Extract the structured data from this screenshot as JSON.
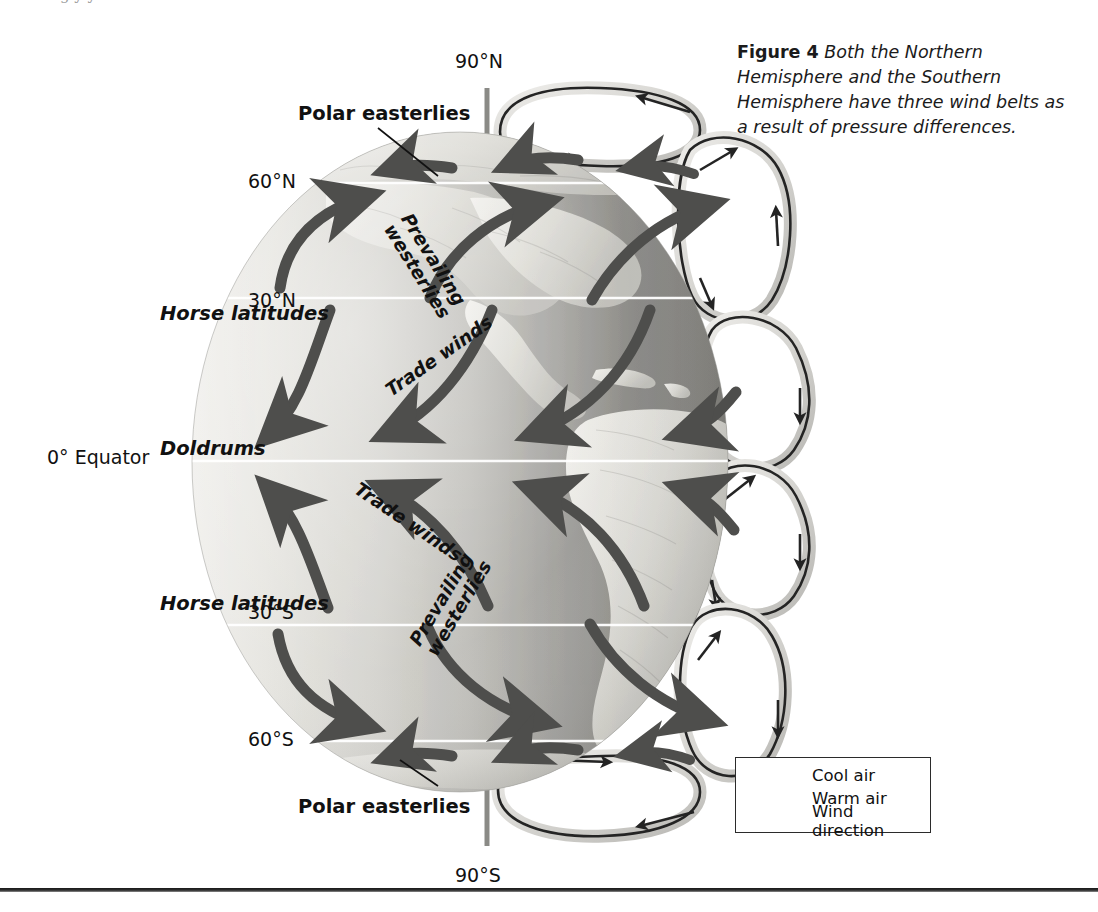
{
  "page": {
    "cutoff_text": "g       y  y"
  },
  "caption": {
    "figure_label": "Figure 4",
    "text": "Both the Northern Hemisphere and the Southern Hemisphere have three wind belts as a result of pressure differences."
  },
  "diagram": {
    "latitude_labels": [
      {
        "id": "north-pole",
        "text": "90°N",
        "x": 455,
        "y": 50
      },
      {
        "id": "sixty-north",
        "text": "60°N",
        "x": 248,
        "y": 170
      },
      {
        "id": "thirty-north",
        "text": "30°N",
        "x": 248,
        "y": 289
      },
      {
        "id": "equator",
        "text": "0° Equator",
        "x": 47,
        "y": 446
      },
      {
        "id": "thirty-south",
        "text": "30°S",
        "x": 248,
        "y": 601
      },
      {
        "id": "sixty-south",
        "text": "60°S",
        "x": 248,
        "y": 728
      },
      {
        "id": "south-pole",
        "text": "90°S",
        "x": 455,
        "y": 864
      }
    ],
    "belt_labels": [
      {
        "id": "horse-latitudes-north",
        "text": "Horse latitudes",
        "x": 160,
        "y": 302
      },
      {
        "id": "doldrums",
        "text": "Doldrums",
        "x": 160,
        "y": 437
      },
      {
        "id": "horse-latitudes-south",
        "text": "Horse latitudes",
        "x": 160,
        "y": 592
      }
    ],
    "leader_labels": [
      {
        "id": "polar-easterlies-north",
        "text": "Polar easterlies",
        "x": 298,
        "y": 102
      },
      {
        "id": "polar-easterlies-south",
        "text": "Polar easterlies",
        "x": 298,
        "y": 795
      }
    ],
    "rotated_labels": [
      {
        "id": "prevailing-westerlies-north",
        "line1": "Prevailing",
        "line2": "westerlies",
        "x": 414,
        "y": 210,
        "angle": 58
      },
      {
        "id": "trade-winds-north",
        "line1": "Trade winds",
        "line2": "",
        "x": 382,
        "y": 384,
        "angle": -35
      },
      {
        "id": "trade-winds-south",
        "line1": "Trade winds",
        "line2": "",
        "x": 362,
        "y": 479,
        "angle": 34
      },
      {
        "id": "prevailing-westerlies-south",
        "line1": "Prevailing",
        "line2": "westerlies",
        "x": 406,
        "y": 639,
        "angle": -59
      }
    ],
    "globe": {
      "center_x": 460,
      "center_y": 462,
      "radius_x": 268,
      "radius_y": 330,
      "light_color": "#e7e6e1",
      "mid_color": "#b9b8b3",
      "dark_color": "#777773",
      "latitude_line_color": "#ffffff"
    },
    "axis": {
      "color": "#8a8a86",
      "north_top": 88,
      "north_bottom": 140,
      "south_top": 785,
      "south_bottom": 845,
      "x": 487
    },
    "cells": {
      "shell_color": "#d9d8d4",
      "fill_color": "#ffffff",
      "flow_color": "#2b2b2b",
      "count": 6
    }
  },
  "legend": {
    "box_label": "Legend",
    "items": [
      {
        "id": "cool-air",
        "label": "Cool air",
        "arrow": "thin-dark-arrow",
        "color": "#3a3a3a"
      },
      {
        "id": "warm-air",
        "label": "Warm air",
        "arrow": "thin-gray-arrow",
        "color": "#8f8f8f"
      },
      {
        "id": "wind-direction",
        "label": "Wind direction",
        "arrow": "tapered-dark-arrow",
        "color": "#4a4a4a"
      }
    ]
  }
}
